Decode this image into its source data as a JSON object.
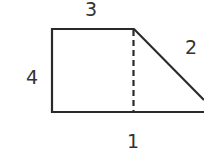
{
  "diagram": {
    "labels": {
      "top": "3",
      "diagonal": "2",
      "left": "4",
      "bottom": "1"
    },
    "colors": {
      "stroke": "#2a2a2a",
      "text": "#333333"
    }
  }
}
